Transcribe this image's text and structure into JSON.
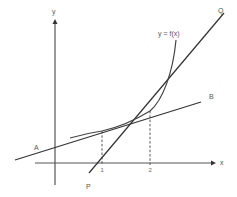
{
  "diagram": {
    "title": "",
    "axes": {
      "x_label": "x",
      "y_label": "y",
      "x_ticks": [
        "1",
        "2"
      ]
    },
    "curve": {
      "label": "y = f(x)"
    },
    "lines": [
      {
        "name": "AB",
        "start_label": "A",
        "end_label": "B",
        "description": "tangent to curve at x = 1"
      },
      {
        "name": "PQ",
        "start_label": "P",
        "end_label": "Q",
        "description": "tangent to curve at x = 2"
      }
    ],
    "colors": {
      "stroke": "#333333",
      "background": "#ffffff"
    }
  }
}
